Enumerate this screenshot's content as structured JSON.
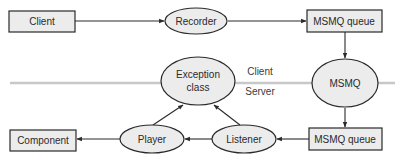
{
  "diagram": {
    "colors": {
      "node_fill": "#ececec",
      "node_stroke": "#2a2a2a",
      "divider": "#c8c8c8",
      "text": "#2a2a2a"
    },
    "boundary": {
      "client_label": "Client",
      "server_label": "Server"
    },
    "nodes": {
      "client": "Client",
      "recorder": "Recorder",
      "msmq_queue_top": "MSMQ queue",
      "msmq": "MSMQ",
      "exception_line1": "Exception",
      "exception_line2": "class",
      "msmq_queue_bottom": "MSMQ queue",
      "listener": "Listener",
      "player": "Player",
      "component": "Component"
    },
    "edges": [
      {
        "from": "Client",
        "to": "Recorder"
      },
      {
        "from": "Recorder",
        "to": "MSMQ queue (top)"
      },
      {
        "from": "MSMQ queue (top)",
        "to": "MSMQ"
      },
      {
        "from": "MSMQ",
        "to": "MSMQ queue (bottom)"
      },
      {
        "from": "MSMQ queue (bottom)",
        "to": "Listener"
      },
      {
        "from": "Listener",
        "to": "Player"
      },
      {
        "from": "Player",
        "to": "Component"
      },
      {
        "from": "Player",
        "to": "Exception class"
      },
      {
        "from": "Listener",
        "to": "Exception class"
      }
    ]
  }
}
